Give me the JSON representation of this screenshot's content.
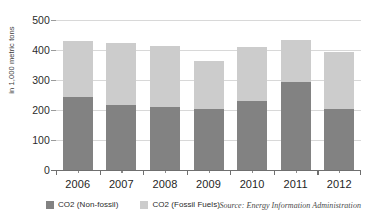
{
  "chart_data": {
    "type": "bar",
    "subtype": "stacked-bar",
    "title": "",
    "xlabel": "",
    "ylabel": "in 1,000 metric tons",
    "categories": [
      "2006",
      "2007",
      "2008",
      "2009",
      "2010",
      "2011",
      "2012"
    ],
    "series": [
      {
        "name": "CO2 (Non-fossil)",
        "color": "#828282",
        "values": [
          245,
          218,
          210,
          205,
          230,
          295,
          205
        ]
      },
      {
        "name": "CO2 (Fossil Fuels)",
        "color": "#cccccc",
        "values": [
          185,
          204,
          205,
          158,
          180,
          140,
          188
        ]
      }
    ],
    "totals": [
      430,
      422,
      415,
      363,
      410,
      435,
      393
    ],
    "ylim": [
      0,
      500
    ],
    "yticks": [
      0,
      100,
      200,
      300,
      400,
      500
    ],
    "ytick_labels": [
      "0",
      "100",
      "200",
      "300",
      "400",
      "500"
    ],
    "grid": true,
    "grid_color": "#d8d8d8",
    "legend_position": "bottom-left",
    "annotations": [
      "Source: Energy Information Administration"
    ]
  },
  "axis": {
    "y_title": "in 1,000 metric tons"
  },
  "legend": {
    "items": [
      {
        "label": "CO2 (Non-fossil)",
        "color": "#828282"
      },
      {
        "label": "CO2 (Fossil Fuels)",
        "color": "#cccccc"
      }
    ]
  },
  "footer": {
    "source": "Source: Energy Information Administration"
  }
}
